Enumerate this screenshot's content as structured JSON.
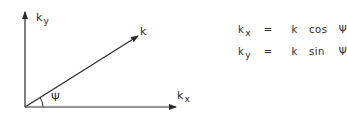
{
  "diagram": {
    "type": "vector-decomposition",
    "axes": {
      "y_label": {
        "base": "k",
        "sub": "y"
      },
      "x_label": {
        "base": "k",
        "sub": "x"
      }
    },
    "vector_label": "k",
    "angle_label": "Ψ",
    "equations": [
      {
        "lhs_base": "k",
        "lhs_sub": "x",
        "op": "=",
        "rhs_k": "k",
        "rhs_fn": "cos",
        "rhs_angle": "Ψ"
      },
      {
        "lhs_base": "k",
        "lhs_sub": "y",
        "op": "=",
        "rhs_k": "k",
        "rhs_fn": "sin",
        "rhs_angle": "Ψ"
      }
    ],
    "colors": {
      "stroke": "#2a2a2a",
      "background": "#ffffff"
    }
  }
}
